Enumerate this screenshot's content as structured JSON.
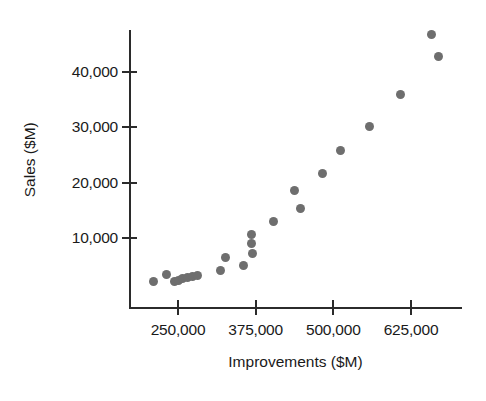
{
  "chart_data": {
    "type": "scatter",
    "title": "",
    "xlabel": "Improvements ($M)",
    "ylabel": "Sales ($M)",
    "xlim": [
      200000,
      735000
    ],
    "ylim": [
      0,
      48000
    ],
    "grid": false,
    "legend": null,
    "marker_color": "#6e6e6e",
    "axis_color": "#2b2b2b",
    "xticks": [
      250000,
      375000,
      500000,
      625000
    ],
    "xtick_labels": [
      "250,000",
      "375,000",
      "500,000",
      "625,000"
    ],
    "yticks": [
      10000,
      20000,
      30000,
      40000
    ],
    "ytick_labels": [
      "10,000",
      "20,000",
      "30,000",
      "40,000"
    ],
    "points": [
      {
        "x": 211000,
        "y": 2200
      },
      {
        "x": 231000,
        "y": 3400
      },
      {
        "x": 245000,
        "y": 2200
      },
      {
        "x": 251000,
        "y": 2400
      },
      {
        "x": 257000,
        "y": 2600
      },
      {
        "x": 265000,
        "y": 2900
      },
      {
        "x": 273000,
        "y": 3000
      },
      {
        "x": 281000,
        "y": 3300
      },
      {
        "x": 318000,
        "y": 4200
      },
      {
        "x": 326000,
        "y": 6500
      },
      {
        "x": 355000,
        "y": 5100
      },
      {
        "x": 368000,
        "y": 10600
      },
      {
        "x": 369000,
        "y": 9000
      },
      {
        "x": 370000,
        "y": 7200
      },
      {
        "x": 403000,
        "y": 13000
      },
      {
        "x": 437000,
        "y": 18500
      },
      {
        "x": 447000,
        "y": 15400
      },
      {
        "x": 483000,
        "y": 21600
      },
      {
        "x": 511000,
        "y": 25800
      },
      {
        "x": 559000,
        "y": 30200
      },
      {
        "x": 608000,
        "y": 36000
      },
      {
        "x": 658000,
        "y": 46800
      },
      {
        "x": 669000,
        "y": 42800
      }
    ]
  }
}
